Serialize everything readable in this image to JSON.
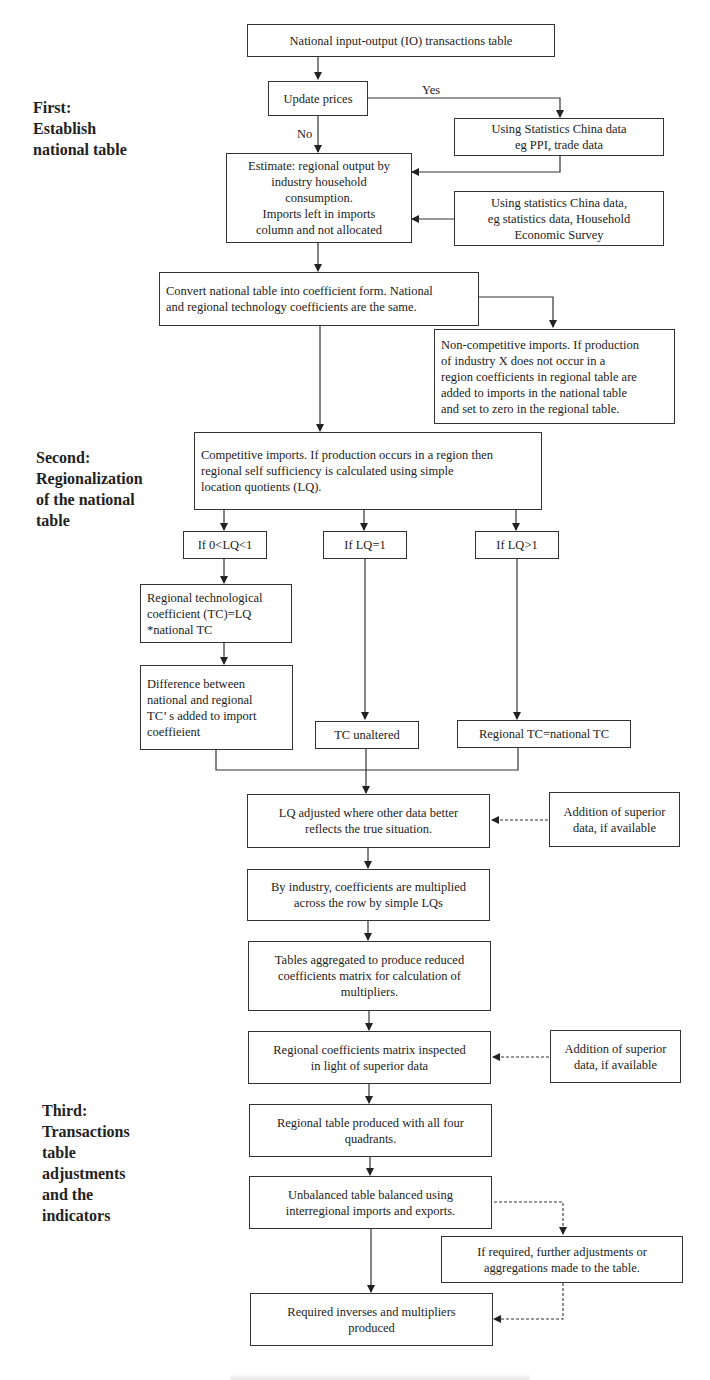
{
  "stages": [
    {
      "label": "First:\nEstablish\nnational table"
    },
    {
      "label": "Second:\nRegionalization\nof the national\ntable"
    },
    {
      "label": "Third:\nTransactions\ntable\nadjustments\nand the\nindicators"
    }
  ],
  "nodes": {
    "national_io": "National input-output (IO) transactions table",
    "update_prices": "Update prices",
    "stats_ppi": "Using Statistics China data\neg PPI, trade data",
    "estimate": "Estimate: regional output by\nindustry household\nconsumption.\nImports left in imports\ncolumn and not allocated",
    "stats_household": "Using statistics China data,\neg statistics data, Household\nEconomic Survey",
    "convert": "Convert national table into coefficient form. National\nand regional technology coefficients are the same.",
    "non_competitive": "Non-competitive imports. If production\nof industry X does not occur in a\nregion coefficients in regional table are\nadded to imports in  the national table\nand set to zero in the regional table.",
    "competitive": "Competitive imports. If production occurs in a region then\nregional self sufficiency is calculated using simple\nlocation quotients (LQ).",
    "lq_lt1": "If 0<LQ<1",
    "lq_eq1": "If LQ=1",
    "lq_gt1": "If LQ>1",
    "regional_tc": "Regional technological\ncoefficient (TC)=LQ\n*national TC",
    "difference": "Difference between\nnational and regional\nTC’ s added to import\ncoeffieient",
    "tc_unaltered": "TC unaltered",
    "regional_eq_national": "Regional TC=national TC",
    "lq_adjusted": "LQ adjusted where other data better\nreflects the true situation.",
    "superior_1": "Addition of superior\ndata, if available",
    "by_industry": "By industry, coefficients are multiplied\nacross the row by simple LQs",
    "aggregated": "Tables aggregated to produce reduced\ncoefficients matrix for calculation of\nmultipliers.",
    "inspected": "Regional coefficients matrix inspected\nin light of superior data",
    "superior_2": "Addition of superior\ndata, if available",
    "four_quadrants": "Regional table produced with all four\nquadrants.",
    "balanced": "Unbalanced table balanced using\ninterregional imports and exports.",
    "further_adjust": "If required, further adjustments or\naggregations made to the table.",
    "inverses": "Required inverses and multipliers\nproduced"
  },
  "edge_labels": {
    "yes": "Yes",
    "no": "No"
  }
}
